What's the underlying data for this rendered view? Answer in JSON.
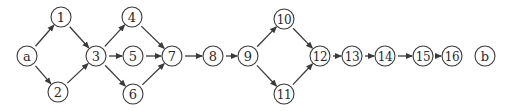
{
  "diagram": {
    "type": "directed-graph",
    "nodes": [
      {
        "id": "a",
        "label": "a",
        "x": 27,
        "y": 56
      },
      {
        "id": "1",
        "label": "1",
        "x": 61,
        "y": 17
      },
      {
        "id": "2",
        "label": "2",
        "x": 58,
        "y": 92
      },
      {
        "id": "3",
        "label": "3",
        "x": 96,
        "y": 56
      },
      {
        "id": "4",
        "label": "4",
        "x": 132,
        "y": 17
      },
      {
        "id": "5",
        "label": "5",
        "x": 133,
        "y": 56
      },
      {
        "id": "6",
        "label": "6",
        "x": 133,
        "y": 94
      },
      {
        "id": "7",
        "label": "7",
        "x": 172,
        "y": 56
      },
      {
        "id": "8",
        "label": "8",
        "x": 213,
        "y": 56
      },
      {
        "id": "9",
        "label": "9",
        "x": 248,
        "y": 56
      },
      {
        "id": "10",
        "label": "10",
        "x": 284,
        "y": 19
      },
      {
        "id": "11",
        "label": "11",
        "x": 284,
        "y": 94
      },
      {
        "id": "12",
        "label": "12",
        "x": 320,
        "y": 56
      },
      {
        "id": "13",
        "label": "13",
        "x": 352,
        "y": 56
      },
      {
        "id": "14",
        "label": "14",
        "x": 385,
        "y": 56
      },
      {
        "id": "15",
        "label": "15",
        "x": 423,
        "y": 56
      },
      {
        "id": "16",
        "label": "16",
        "x": 452,
        "y": 56
      },
      {
        "id": "b",
        "label": "b",
        "x": 485,
        "y": 56
      }
    ],
    "edges": [
      [
        "a",
        "1"
      ],
      [
        "a",
        "2"
      ],
      [
        "1",
        "3"
      ],
      [
        "2",
        "3"
      ],
      [
        "3",
        "4"
      ],
      [
        "3",
        "5"
      ],
      [
        "3",
        "6"
      ],
      [
        "4",
        "7"
      ],
      [
        "5",
        "7"
      ],
      [
        "6",
        "7"
      ],
      [
        "7",
        "8"
      ],
      [
        "8",
        "9"
      ],
      [
        "9",
        "10"
      ],
      [
        "9",
        "11"
      ],
      [
        "10",
        "12"
      ],
      [
        "11",
        "12"
      ],
      [
        "12",
        "13"
      ],
      [
        "13",
        "14"
      ],
      [
        "14",
        "15"
      ],
      [
        "15",
        "16"
      ]
    ],
    "node_radius": 10
  }
}
